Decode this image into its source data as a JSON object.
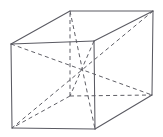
{
  "figure": {
    "background_color": "#ffffff",
    "visible_edge_color": "#5a5a62",
    "hidden_edge_color": "#5f5f66",
    "visible_edge_width": "1.05",
    "hidden_edge_width": "1.0",
    "hidden_dash_pattern": "4 3.2"
  },
  "geometry": {
    "canvas": {
      "width": 163,
      "height": 137
    },
    "vertices": {
      "front_top_left": {
        "name": "A",
        "x": 11,
        "y": 44,
        "hidden": false
      },
      "front_top_right": {
        "name": "B",
        "x": 94,
        "y": 41,
        "hidden": false
      },
      "front_bottom_right": {
        "name": "C",
        "x": 95,
        "y": 129,
        "hidden": false
      },
      "front_bottom_left": {
        "name": "D",
        "x": 12,
        "y": 128,
        "hidden": false
      },
      "back_top_left": {
        "name": "E",
        "x": 70,
        "y": 11,
        "hidden": false
      },
      "back_top_right": {
        "name": "F",
        "x": 153,
        "y": 11,
        "hidden": false
      },
      "back_bottom_right": {
        "name": "G",
        "x": 152,
        "y": 95,
        "hidden": false
      },
      "back_bottom_left": {
        "name": "H",
        "x": 70,
        "y": 96,
        "hidden": true
      }
    },
    "center": {
      "x": 81.5,
      "y": 70.5
    },
    "visible_edges": [
      {
        "from": "front_top_left",
        "to": "front_top_right",
        "d": "M 11 44 L 94 41"
      },
      {
        "from": "front_top_right",
        "to": "front_bottom_right",
        "d": "M 94 41 L 95 129"
      },
      {
        "from": "front_bottom_right",
        "to": "front_bottom_left",
        "d": "M 95 129 L 12 128"
      },
      {
        "from": "front_bottom_left",
        "to": "front_top_left",
        "d": "M 12 128 L 11 44"
      },
      {
        "from": "back_top_left",
        "to": "back_top_right",
        "d": "M 70 11 L 153 11"
      },
      {
        "from": "back_top_right",
        "to": "back_bottom_right",
        "d": "M 153 11 L 152 95"
      },
      {
        "from": "front_top_left",
        "to": "back_top_left",
        "d": "M 11 44 L 70 11"
      },
      {
        "from": "front_top_right",
        "to": "back_top_right",
        "d": "M 94 41 L 153 11"
      },
      {
        "from": "front_bottom_right",
        "to": "back_bottom_right",
        "d": "M 95 129 L 152 95"
      }
    ],
    "hidden_edges": [
      {
        "from": "back_bottom_left",
        "to": "back_top_left",
        "d": "M 70 96 L 70 11"
      },
      {
        "from": "back_bottom_left",
        "to": "back_bottom_right",
        "d": "M 70 96 L 152 95"
      },
      {
        "from": "back_bottom_left",
        "to": "front_bottom_left",
        "d": "M 70 96 L 12 128"
      }
    ],
    "space_diagonals": [
      {
        "from": "front_top_left",
        "to": "back_bottom_right",
        "d": "M 11 44 L 152 95"
      },
      {
        "from": "back_top_right",
        "to": "front_bottom_left",
        "d": "M 153 11 L 12 128"
      },
      {
        "from": "back_top_left",
        "to": "front_bottom_right",
        "d": "M 70 11 L 95 129"
      },
      {
        "from": "front_top_right",
        "to": "back_bottom_left",
        "d": "M 94 41 L 70 96"
      }
    ]
  }
}
